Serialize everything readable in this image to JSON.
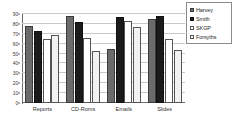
{
  "chart_data": {
    "type": "bar",
    "title": "",
    "subtitle": "",
    "xlabel": "",
    "ylabel": "",
    "categories": [
      "Reports",
      "CD-Roms",
      "Emails",
      "Slides"
    ],
    "series": [
      {
        "name": "Harvey",
        "color": "#6b6b6b",
        "values": [
          78,
          88,
          55,
          85
        ]
      },
      {
        "name": "Smith",
        "color": "#1b1b1b",
        "values": [
          73,
          82,
          87,
          88
        ]
      },
      {
        "name": "SKGP",
        "color": "#ffffff",
        "values": [
          65,
          66,
          83,
          65
        ]
      },
      {
        "name": "Forsyths",
        "color": "#f2f2f2",
        "values": [
          69,
          53,
          77,
          54
        ]
      }
    ],
    "ylim": [
      0,
      90
    ],
    "yticks": [
      0,
      10,
      20,
      30,
      40,
      50,
      60,
      70,
      80,
      90
    ],
    "ytick_labels": [
      "0",
      "10",
      "20",
      "30",
      "40",
      "50",
      "60",
      "70",
      "80",
      "90"
    ],
    "grid": true,
    "grid_axis": "y",
    "legend_position": "right",
    "legend_entries": [
      "Harvey",
      "Smith",
      "SKGP",
      "Forsyths"
    ]
  }
}
